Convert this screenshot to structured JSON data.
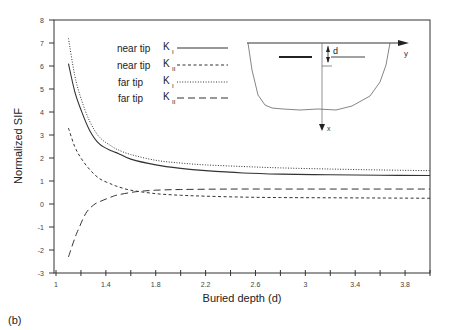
{
  "panel_label": "(b)",
  "chart_data": {
    "type": "line",
    "title": "",
    "xlabel": "Buried depth  (d)",
    "ylabel": "Normalized SIF",
    "xlim": [
      1,
      4
    ],
    "ylim": [
      -3,
      8
    ],
    "x_ticks": [
      1,
      1.4,
      1.8,
      2.2,
      2.6,
      3,
      3.4,
      3.8
    ],
    "x_minor_step": 0.2,
    "y_ticks": [
      -3,
      -2,
      -1,
      0,
      1,
      2,
      3,
      4,
      5,
      6,
      7,
      8
    ],
    "grid": false,
    "legend_position": "upper center",
    "series": [
      {
        "name": "near tip K_I",
        "legend_label": "near tip",
        "sub": "I",
        "style": "solid",
        "x": [
          1.1,
          1.15,
          1.2,
          1.27,
          1.35,
          1.45,
          1.5,
          1.6,
          1.8,
          2.0,
          2.2,
          2.5,
          2.8,
          3.2,
          3.6,
          4.0
        ],
        "y": [
          6.1,
          4.9,
          4.1,
          3.2,
          2.6,
          2.3,
          2.2,
          1.95,
          1.7,
          1.55,
          1.45,
          1.35,
          1.3,
          1.27,
          1.25,
          1.24
        ]
      },
      {
        "name": "near tip K_II",
        "legend_label": "near tip",
        "sub": "II",
        "style": "short-dash",
        "x": [
          1.1,
          1.15,
          1.2,
          1.27,
          1.35,
          1.45,
          1.5,
          1.6,
          1.8,
          2.0,
          2.2,
          2.5,
          2.8,
          3.2,
          3.6,
          4.0
        ],
        "y": [
          3.3,
          2.5,
          2.0,
          1.5,
          1.1,
          0.85,
          0.75,
          0.6,
          0.45,
          0.38,
          0.34,
          0.3,
          0.28,
          0.27,
          0.26,
          0.25
        ]
      },
      {
        "name": "far tip K_I",
        "legend_label": "far tip",
        "sub": "I",
        "style": "dotted",
        "x": [
          1.1,
          1.15,
          1.2,
          1.27,
          1.35,
          1.45,
          1.5,
          1.6,
          1.8,
          2.0,
          2.2,
          2.5,
          2.8,
          3.2,
          3.6,
          4.0
        ],
        "y": [
          7.2,
          5.6,
          4.6,
          3.6,
          2.9,
          2.5,
          2.35,
          2.15,
          1.9,
          1.78,
          1.7,
          1.63,
          1.57,
          1.52,
          1.48,
          1.45
        ]
      },
      {
        "name": "far tip K_II",
        "legend_label": "far tip",
        "sub": "II",
        "style": "long-dash",
        "x": [
          1.1,
          1.15,
          1.18,
          1.24,
          1.3,
          1.35,
          1.45,
          1.5,
          1.6,
          1.67,
          1.8,
          2.0,
          2.4,
          2.8,
          3.2,
          3.6,
          4.0
        ],
        "y": [
          -2.3,
          -1.5,
          -1.1,
          -0.4,
          -0.05,
          0.1,
          0.32,
          0.4,
          0.5,
          0.55,
          0.6,
          0.63,
          0.65,
          0.65,
          0.65,
          0.65,
          0.65
        ]
      }
    ],
    "inset": {
      "description": "cross-section schematic with buried crack at depth d",
      "labels": {
        "depth": "d",
        "horizontal_axis": "y",
        "vertical_axis": "x"
      }
    }
  }
}
